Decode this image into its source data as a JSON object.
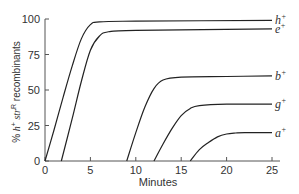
{
  "chart_data": {
    "type": "line",
    "title": "",
    "xlabel": "Minutes",
    "ylabel": "% h+ str R recombinants",
    "ylabel_parts": {
      "prefix": "% ",
      "h": "h",
      "h_sup": "+",
      "str": " str",
      "str_sup": "R",
      "suffix": " recombinants"
    },
    "xlim": [
      0,
      25
    ],
    "ylim": [
      0,
      100
    ],
    "xticks": [
      0,
      5,
      10,
      15,
      20,
      25
    ],
    "yticks": [
      0,
      25,
      50,
      75,
      100
    ],
    "grid": false,
    "legend_position": "inline-right",
    "series": [
      {
        "name": "h+",
        "label": "h",
        "sup": "+",
        "x": [
          0,
          1,
          2,
          3,
          4,
          5,
          6,
          10,
          25
        ],
        "y": [
          0,
          22,
          45,
          67,
          86,
          96,
          98,
          98.5,
          99
        ]
      },
      {
        "name": "e+",
        "label": "e",
        "sup": "+",
        "x": [
          1.8,
          3,
          4,
          5,
          6,
          7,
          10,
          25
        ],
        "y": [
          0,
          30,
          56,
          78,
          88,
          91,
          92,
          93
        ]
      },
      {
        "name": "b+",
        "label": "b",
        "sup": "+",
        "x": [
          9,
          10,
          11,
          12,
          13,
          15,
          20,
          25
        ],
        "y": [
          0,
          20,
          38,
          51,
          57,
          59,
          59.5,
          60
        ]
      },
      {
        "name": "g+",
        "label": "g",
        "sup": "+",
        "x": [
          12,
          13,
          14,
          15,
          16,
          17,
          20,
          25
        ],
        "y": [
          0,
          12,
          23,
          32,
          37,
          39,
          40,
          40
        ]
      },
      {
        "name": "a+",
        "label": "a",
        "sup": "+",
        "x": [
          16,
          17,
          18,
          19,
          20,
          21,
          22,
          25
        ],
        "y": [
          0,
          8,
          13,
          17,
          19,
          19.7,
          20,
          20
        ]
      }
    ]
  }
}
